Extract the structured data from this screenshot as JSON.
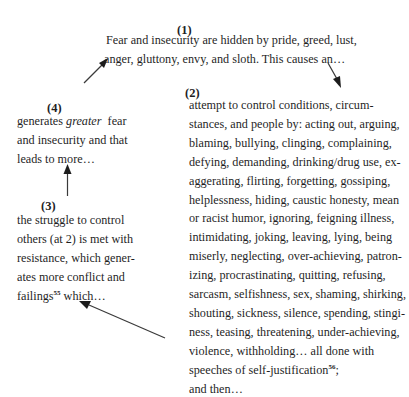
{
  "diagram": {
    "type": "cycle",
    "nodes": [
      {
        "id": "1",
        "label": "(1)",
        "lines": [
          "Fear and insecurity are hidden by pride, greed, lust,",
          "anger, gluttony, envy, and sloth. This causes an…"
        ]
      },
      {
        "id": "2",
        "label": "(2)",
        "lines": [
          "attempt to control conditions, circum-",
          "stances, and people by: acting out, arguing,",
          "blaming, bullying, clinging, complaining,",
          "defying, demanding, drinking/drug use, ex-",
          "aggerating, flirting, forgetting, gossiping,",
          "helplessness, hiding, caustic honesty, mean",
          "or racist humor, ignoring, feigning illness,",
          "intimidating, joking, leaving, lying, being",
          "miserly, neglecting, over-achieving, patron-",
          "izing, procrastinating, quitting, refusing,",
          "sarcasm, selfishness, sex, shaming, shirking,",
          "shouting, sickness, silence, spending, stingi-",
          "ness, teasing, threatening, under-achieving,",
          "violence, withholding… all done with"
        ],
        "last_line_pre": "speeches of self-justification",
        "last_line_sup": "56",
        "last_line_post": ";",
        "closing": "and then…"
      },
      {
        "id": "3",
        "label": "(3)",
        "lines": [
          "the struggle to control",
          "others (at 2) is met with",
          "resistance, which gener-",
          "ates more conflict and"
        ],
        "last_line_pre": "failings",
        "last_line_sup": "55",
        "last_line_post": " which…"
      },
      {
        "id": "4",
        "label": "(4)",
        "line1_pre": "generates ",
        "line1_em": "greater",
        "line1_post": "  fear",
        "lines": [
          "and insecurity and that",
          "leads to more…"
        ]
      }
    ],
    "edges": [
      {
        "from": "1",
        "to": "2",
        "icon": "arrow-down-right-icon"
      },
      {
        "from": "2",
        "to": "3",
        "icon": "arrow-up-left-icon"
      },
      {
        "from": "3",
        "to": "4",
        "icon": "arrow-up-icon"
      },
      {
        "from": "4",
        "to": "1",
        "icon": "arrow-up-right-icon"
      }
    ],
    "colors": {
      "text": "#1f1f1f",
      "arrow": "#2a2a2a",
      "background": "#ffffff"
    }
  }
}
